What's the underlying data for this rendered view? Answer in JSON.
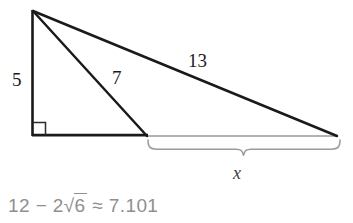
{
  "figure": {
    "type": "geometry-diagram",
    "colors": {
      "stroke_dark": "#1a1a1a",
      "stroke_light": "#9a9a9a",
      "text_dark": "#1a1a1a",
      "text_gray": "#8f8f8f",
      "background": "#ffffff"
    },
    "vertices": {
      "apex": {
        "x": 32,
        "y": 10
      },
      "bottom_left": {
        "x": 32,
        "y": 136
      },
      "mid_base": {
        "x": 147,
        "y": 136
      },
      "bottom_right": {
        "x": 337,
        "y": 136
      }
    },
    "right_angle_marker": {
      "x": 32,
      "y": 136,
      "size": 13,
      "name": "right-angle-square"
    },
    "labels": [
      {
        "id": "leg-5",
        "text": "5",
        "x": 12,
        "y": 70
      },
      {
        "id": "cevian-7",
        "text": "7",
        "x": 112,
        "y": 68
      },
      {
        "id": "hypotenuse-13",
        "text": "13",
        "x": 188,
        "y": 51
      },
      {
        "id": "segment-x",
        "text": "x",
        "x": 233,
        "y": 164
      }
    ],
    "brace": {
      "name": "measurement-brace",
      "left_x": 148,
      "right_x": 340,
      "top_y": 139,
      "bottom_y": 156,
      "label": "x"
    }
  },
  "answer": {
    "prefix": "12",
    "minus": "−",
    "coefficient": "2",
    "radical": "√",
    "radicand": "6",
    "approx": "≈",
    "value": "7.101",
    "full_text": "12 − 2√6 ≈ 7.101"
  }
}
